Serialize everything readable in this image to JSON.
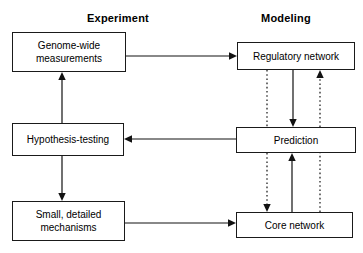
{
  "figure": {
    "type": "flow-diagram",
    "background_color": "#ffffff",
    "line_color": "#121212",
    "headings": [
      {
        "id": "experiment",
        "label": "Experiment"
      },
      {
        "id": "modeling",
        "label": "Modeling"
      }
    ],
    "nodes": [
      {
        "id": "genome-wide-measurements",
        "label": "Genome-wide\nmeasurements",
        "column": "experiment"
      },
      {
        "id": "hypothesis-testing",
        "label": "Hypothesis-testing",
        "column": "experiment"
      },
      {
        "id": "small-detailed-mechanisms",
        "label": "Small, detailed\nmechanisms",
        "column": "experiment"
      },
      {
        "id": "regulatory-network",
        "label": "Regulatory network",
        "column": "modeling"
      },
      {
        "id": "prediction",
        "label": "Prediction",
        "column": "modeling"
      },
      {
        "id": "core-network",
        "label": "Core network",
        "column": "modeling"
      }
    ],
    "edges": [
      {
        "id": "genome-to-regulatory",
        "from": "genome-wide-measurements",
        "to": "regulatory-network",
        "style": "solid",
        "direction": "right"
      },
      {
        "id": "hypothesis-to-genome",
        "from": "hypothesis-testing",
        "to": "genome-wide-measurements",
        "style": "solid",
        "direction": "up"
      },
      {
        "id": "hypothesis-to-mechanisms",
        "from": "hypothesis-testing",
        "to": "small-detailed-mechanisms",
        "style": "solid",
        "direction": "down"
      },
      {
        "id": "mechanisms-to-core",
        "from": "small-detailed-mechanisms",
        "to": "core-network",
        "style": "solid",
        "direction": "right"
      },
      {
        "id": "prediction-to-hypothesis",
        "from": "prediction",
        "to": "hypothesis-testing",
        "style": "solid",
        "direction": "left"
      },
      {
        "id": "regulatory-to-prediction",
        "from": "regulatory-network",
        "to": "prediction",
        "style": "solid",
        "direction": "down"
      },
      {
        "id": "core-to-prediction",
        "from": "core-network",
        "to": "prediction",
        "style": "solid",
        "direction": "up"
      },
      {
        "id": "regulatory-to-core",
        "from": "regulatory-network",
        "to": "core-network",
        "style": "dotted",
        "direction": "down"
      },
      {
        "id": "core-to-regulatory",
        "from": "core-network",
        "to": "regulatory-network",
        "style": "dotted",
        "direction": "up"
      }
    ]
  }
}
